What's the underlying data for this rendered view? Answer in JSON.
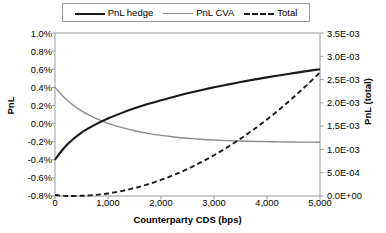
{
  "legend": {
    "position": "top-center",
    "entries": [
      {
        "label": "PnL hedge",
        "style": "solid-thick",
        "color": "#1a1a1a",
        "icon": "legend-line-icon"
      },
      {
        "label": "PnL CVA",
        "style": "solid-thin",
        "color": "#8a8a8a",
        "icon": "legend-line-icon"
      },
      {
        "label": "Total",
        "style": "dashed",
        "color": "#1a1a1a",
        "icon": "legend-dashed-line-icon"
      }
    ]
  },
  "chart_data": {
    "type": "line",
    "title": "",
    "xlabel": "Counterparty CDS (bps)",
    "ylabel": "PnL",
    "y2label": "PnL (total)",
    "xlim": [
      0,
      5000
    ],
    "ylim": [
      -0.008,
      0.01
    ],
    "y2lim": [
      0.0,
      0.0035
    ],
    "grid": false,
    "xticks": [
      0,
      1000,
      2000,
      3000,
      4000,
      5000
    ],
    "xticklabels": [
      "0",
      "1,000",
      "2,000",
      "3,000",
      "4,000",
      "5,000"
    ],
    "yticks": [
      -0.008,
      -0.006,
      -0.004,
      -0.002,
      0.0,
      0.002,
      0.004,
      0.006,
      0.008,
      0.01
    ],
    "yticklabels": [
      "-0.8%",
      "-0.6%",
      "-0.4%",
      "-0.2%",
      "0.0%",
      "0.2%",
      "0.4%",
      "0.6%",
      "0.8%",
      "1.0%"
    ],
    "y2ticks": [
      0.0,
      0.0005,
      0.001,
      0.0015,
      0.002,
      0.0025,
      0.003,
      0.0035
    ],
    "y2ticklabels": [
      "0.0E+00",
      "5.0E-04",
      "1.0E-03",
      "1.5E-03",
      "2.0E-03",
      "2.5E-03",
      "3.0E-03",
      "3.5E-03"
    ],
    "x": [
      0,
      100,
      250,
      500,
      750,
      1000,
      1250,
      1500,
      1750,
      2000,
      2250,
      2500,
      2750,
      3000,
      3250,
      3500,
      3750,
      4000,
      4250,
      4500,
      4750,
      5000
    ],
    "series": [
      {
        "name": "PnL hedge",
        "axis": "left",
        "color": "#1a1a1a",
        "style": "solid-thick",
        "values": [
          -0.004,
          -0.0032,
          -0.0022,
          -0.001,
          -0.00015,
          0.00055,
          0.00115,
          0.00168,
          0.00215,
          0.00258,
          0.00297,
          0.00334,
          0.00368,
          0.004,
          0.0043,
          0.00458,
          0.00485,
          0.0051,
          0.00534,
          0.00557,
          0.00579,
          0.006
        ]
      },
      {
        "name": "PnL CVA",
        "axis": "left",
        "color": "#8a8a8a",
        "style": "solid-thin",
        "values": [
          0.004,
          0.00333,
          0.00247,
          0.0014,
          0.00062,
          2e-05,
          -0.00043,
          -0.0008,
          -0.00108,
          -0.0013,
          -0.00148,
          -0.00162,
          -0.00173,
          -0.00182,
          -0.00188,
          -0.00193,
          -0.00197,
          -0.002,
          -0.00202,
          -0.00204,
          -0.00205,
          -0.00206
        ]
      },
      {
        "name": "Total",
        "axis": "right",
        "color": "#1a1a1a",
        "style": "dashed",
        "values": [
          2.5e-05,
          8e-06,
          0.0,
          4e-06,
          2.2e-05,
          5.5e-05,
          0.000105,
          0.00017,
          0.00025,
          0.000345,
          0.000455,
          0.00058,
          0.00072,
          0.000875,
          0.001045,
          0.00123,
          0.00143,
          0.001645,
          0.001875,
          0.00212,
          0.00238,
          0.002655
        ]
      }
    ]
  }
}
